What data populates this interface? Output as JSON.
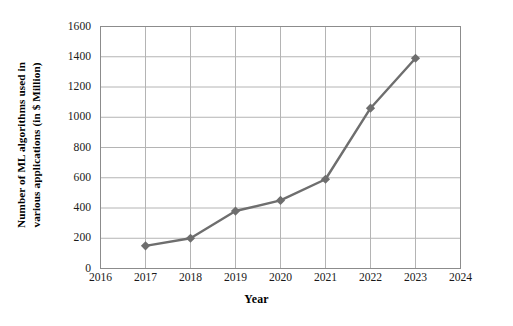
{
  "chart_data": {
    "type": "line",
    "title": "",
    "subtitle": "",
    "xlabel": "Year",
    "ylabel": "Number of ML algorithms used in various applications (in $ Million)",
    "ylabel_lines": [
      "Number of ML algorithms used in",
      "various applications (in $ Million)"
    ],
    "categories": [
      2017,
      2018,
      2019,
      2020,
      2021,
      2022,
      2023
    ],
    "x": [
      2017,
      2018,
      2019,
      2020,
      2021,
      2022,
      2023
    ],
    "values": [
      150,
      200,
      380,
      450,
      590,
      1060,
      1390
    ],
    "series": [
      {
        "name": "Number of ML algorithms used in various applications",
        "values": [
          150,
          200,
          380,
          450,
          590,
          1060,
          1390
        ]
      }
    ],
    "xlim": [
      2016,
      2024
    ],
    "ylim": [
      0,
      1600
    ],
    "xticks": [
      2016,
      2017,
      2018,
      2019,
      2020,
      2021,
      2022,
      2023,
      2024
    ],
    "xtick_labels": [
      "2016",
      "2017",
      "2018",
      "2019",
      "2020",
      "2021",
      "2022",
      "2023",
      "2024"
    ],
    "yticks": [
      0,
      200,
      400,
      600,
      800,
      1000,
      1200,
      1400,
      1600
    ],
    "ytick_labels": [
      "0",
      "200",
      "400",
      "600",
      "800",
      "1000",
      "1200",
      "1400",
      "1600"
    ],
    "grid": true,
    "grid_axes": "both",
    "legend": false,
    "legend_position": "none",
    "marker": "diamond",
    "annotations": []
  },
  "style": {
    "line_color": "#6e6e6e",
    "marker_color": "#6e6e6e",
    "grid_color": "#b4b4b4",
    "axis_color": "#8c8c8c",
    "background": "#ffffff",
    "text_color": "#000000"
  }
}
